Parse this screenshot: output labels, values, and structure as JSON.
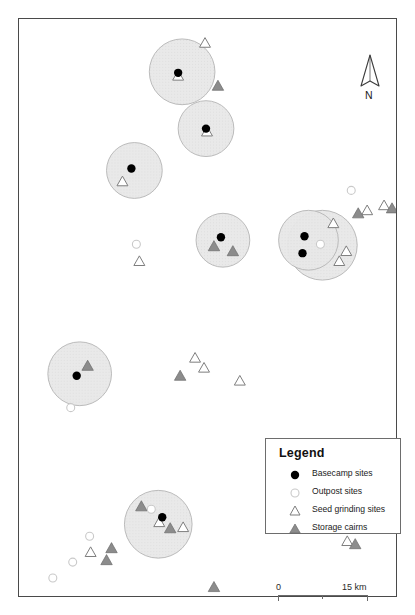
{
  "map": {
    "title": "Archaeological site distribution map",
    "frame": {
      "x": 18,
      "y": 18,
      "width": 379,
      "height": 579
    },
    "north_arrow": {
      "label": "N"
    },
    "scalebar": {
      "min_label": "0",
      "max_label": "15 km",
      "length_px": 90,
      "units": "km",
      "max_value": 15
    },
    "colors": {
      "buffer_fill": "#e8e8e8",
      "buffer_stroke": "#b4b4b4",
      "basecamp": "#000000",
      "outpost_stroke": "#c9c9c9",
      "outpost_fill": "#ffffff",
      "seed_stroke": "#7d7d7d",
      "cairn_fill": "#8c8c8c",
      "cairn_stroke": "#6b6b6b",
      "frame": "#4a4a4a"
    }
  },
  "legend": {
    "title": "Legend",
    "items": [
      {
        "symbol": "basecamp-dot",
        "label": "Basecamp sites"
      },
      {
        "symbol": "outpost-circle",
        "label": "Outpost sites"
      },
      {
        "symbol": "seed-triangle",
        "label": "Seed grinding sites"
      },
      {
        "symbol": "cairn-triangle",
        "label": "Storage cairns"
      }
    ]
  },
  "chart_data": {
    "type": "scatter",
    "xlabel": "",
    "ylabel": "",
    "grid": false,
    "legend_position": "bottom-right",
    "coordinate_space": {
      "units": "px",
      "width": 379,
      "height": 579,
      "origin": "frame-top-left"
    },
    "buffers": [
      {
        "cx": 164,
        "cy": 53,
        "r": 33
      },
      {
        "cx": 188,
        "cy": 110,
        "r": 28
      },
      {
        "cx": 116,
        "cy": 152,
        "r": 28
      },
      {
        "cx": 205,
        "cy": 222,
        "r": 27
      },
      {
        "cx": 305,
        "cy": 227,
        "r": 35
      },
      {
        "cx": 291,
        "cy": 222,
        "r": 30
      },
      {
        "cx": 61,
        "cy": 356,
        "r": 32
      },
      {
        "cx": 140,
        "cy": 507,
        "r": 34
      }
    ],
    "series": [
      {
        "name": "Basecamp sites",
        "symbol": "filled-circle",
        "color": "#000000",
        "points": [
          {
            "x": 160,
            "y": 54
          },
          {
            "x": 188,
            "y": 110
          },
          {
            "x": 113,
            "y": 150
          },
          {
            "x": 203,
            "y": 219
          },
          {
            "x": 287,
            "y": 218
          },
          {
            "x": 285,
            "y": 235
          },
          {
            "x": 58,
            "y": 358
          },
          {
            "x": 144,
            "y": 500
          }
        ]
      },
      {
        "name": "Outpost sites",
        "symbol": "open-circle",
        "color": "#c9c9c9",
        "points": [
          {
            "x": 118,
            "y": 226
          },
          {
            "x": 303,
            "y": 226
          },
          {
            "x": 334,
            "y": 172
          },
          {
            "x": 52,
            "y": 390
          },
          {
            "x": 133,
            "y": 492
          },
          {
            "x": 71,
            "y": 519
          },
          {
            "x": 54,
            "y": 545
          },
          {
            "x": 34,
            "y": 561
          }
        ]
      },
      {
        "name": "Seed grinding sites",
        "symbol": "open-triangle",
        "color": "#7d7d7d",
        "points": [
          {
            "x": 187,
            "y": 24
          },
          {
            "x": 160,
            "y": 57
          },
          {
            "x": 189,
            "y": 113
          },
          {
            "x": 104,
            "y": 163
          },
          {
            "x": 121,
            "y": 243
          },
          {
            "x": 316,
            "y": 205
          },
          {
            "x": 350,
            "y": 192
          },
          {
            "x": 367,
            "y": 187
          },
          {
            "x": 329,
            "y": 233
          },
          {
            "x": 322,
            "y": 243
          },
          {
            "x": 177,
            "y": 340
          },
          {
            "x": 186,
            "y": 350
          },
          {
            "x": 222,
            "y": 363
          },
          {
            "x": 141,
            "y": 505
          },
          {
            "x": 72,
            "y": 535
          },
          {
            "x": 352,
            "y": 491
          },
          {
            "x": 330,
            "y": 524
          },
          {
            "x": 165,
            "y": 510
          }
        ]
      },
      {
        "name": "Storage cairns",
        "symbol": "filled-triangle",
        "color": "#8c8c8c",
        "points": [
          {
            "x": 200,
            "y": 67
          },
          {
            "x": 196,
            "y": 228
          },
          {
            "x": 215,
            "y": 233
          },
          {
            "x": 341,
            "y": 195
          },
          {
            "x": 375,
            "y": 190
          },
          {
            "x": 69,
            "y": 348
          },
          {
            "x": 162,
            "y": 358
          },
          {
            "x": 123,
            "y": 489
          },
          {
            "x": 152,
            "y": 511
          },
          {
            "x": 93,
            "y": 531
          },
          {
            "x": 88,
            "y": 543
          },
          {
            "x": 196,
            "y": 570
          },
          {
            "x": 338,
            "y": 527
          }
        ]
      }
    ]
  }
}
